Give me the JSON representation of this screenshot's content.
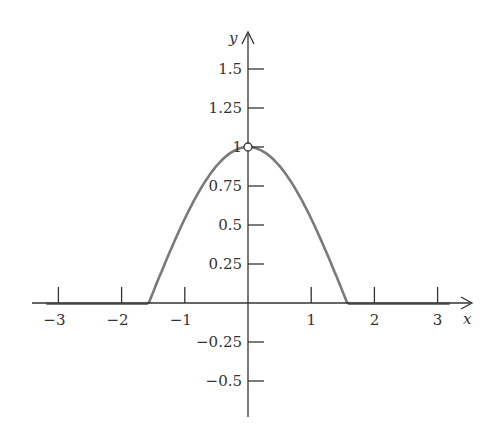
{
  "chart_data": {
    "type": "line",
    "title": "",
    "xlabel": "x",
    "ylabel": "y",
    "function": "cos(x)",
    "xlim": [
      -3.25,
      3.5
    ],
    "ylim": [
      -0.75,
      1.75
    ],
    "x_ticks": [
      -3,
      -2,
      -1,
      1,
      2,
      3
    ],
    "x_tick_labels": [
      "−3",
      "−2",
      "−1",
      "1",
      "2",
      "3"
    ],
    "y_ticks": [
      1.5,
      1.25,
      1,
      0.75,
      0.5,
      0.25,
      -0.25,
      -0.5
    ],
    "y_tick_labels": [
      "1.5",
      "1.25",
      "1",
      "0.75",
      "0.5",
      "0.25",
      "−0.25",
      "−0.5"
    ],
    "grid": false,
    "legend": null,
    "annotations": [
      {
        "type": "open-circle",
        "x": 0,
        "y": 1
      }
    ],
    "series": [
      {
        "name": "cos(x)",
        "x": [
          -3.14,
          -3,
          -2.5,
          -2,
          -1.5,
          -1,
          -0.5,
          0,
          0.5,
          1,
          1.5,
          2,
          2.5,
          3,
          3.14
        ],
        "values": [
          0,
          -0.01,
          -0.8,
          -0.42,
          0.07,
          0.54,
          0.88,
          1,
          0.88,
          0.54,
          0.07,
          -0.42,
          -0.8,
          -0.99,
          0
        ]
      }
    ],
    "curve_color": "#777777",
    "axis_color": "#333333"
  }
}
